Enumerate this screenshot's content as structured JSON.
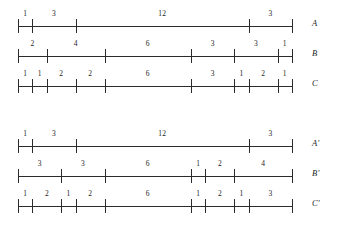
{
  "figure": {
    "kind": "segmented-ruler-diagram",
    "axis": {
      "left_px": 18,
      "right_px": 292,
      "total_units": 19,
      "units_to_px": 14.421
    },
    "rows": [
      {
        "name": "A",
        "top_px": 6,
        "segments": [
          1,
          3,
          12,
          3
        ],
        "labels": [
          "1",
          "3",
          "12",
          "3"
        ],
        "boundaries": [
          0,
          1,
          4,
          16,
          19
        ]
      },
      {
        "name": "B",
        "top_px": 36,
        "segments": [
          2,
          4,
          6,
          3,
          3,
          1
        ],
        "labels": [
          "2",
          "4",
          "6",
          "3",
          "3",
          "1"
        ],
        "boundaries": [
          0,
          2,
          6,
          12,
          15,
          18,
          19
        ]
      },
      {
        "name": "C",
        "top_px": 66,
        "segments": [
          1,
          1,
          2,
          2,
          6,
          3,
          1,
          2,
          1
        ],
        "labels": [
          "1",
          "1",
          "2",
          "2",
          "6",
          "3",
          "1",
          "2",
          "1"
        ],
        "boundaries": [
          0,
          1,
          2,
          4,
          6,
          12,
          15,
          16,
          18,
          19
        ]
      },
      {
        "name": "A'",
        "top_px": 126,
        "segments": [
          1,
          3,
          12,
          3
        ],
        "labels": [
          "1",
          "3",
          "12",
          "3"
        ],
        "boundaries": [
          0,
          1,
          4,
          16,
          19
        ]
      },
      {
        "name": "B'",
        "top_px": 156,
        "segments": [
          3,
          3,
          6,
          1,
          2,
          4
        ],
        "labels": [
          "3",
          "3",
          "6",
          "1",
          "2",
          "4"
        ],
        "boundaries": [
          0,
          3,
          6,
          12,
          13,
          15,
          19
        ]
      },
      {
        "name": "C'",
        "top_px": 186,
        "segments": [
          1,
          2,
          1,
          2,
          6,
          1,
          2,
          1,
          3
        ],
        "labels": [
          "1",
          "2",
          "1",
          "2",
          "6",
          "1",
          "2",
          "1",
          "3"
        ],
        "boundaries": [
          0,
          1,
          3,
          4,
          6,
          12,
          13,
          15,
          16,
          19
        ]
      }
    ]
  }
}
